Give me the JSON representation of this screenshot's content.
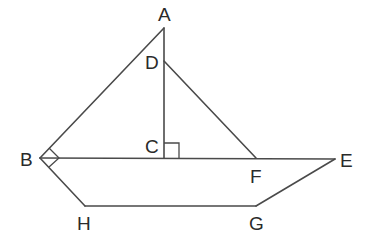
{
  "diagram": {
    "type": "geometry",
    "points": {
      "A": {
        "label": "A",
        "x": 164,
        "y": 28
      },
      "D": {
        "label": "D",
        "x": 164,
        "y": 61
      },
      "C": {
        "label": "C",
        "x": 164,
        "y": 158
      },
      "B": {
        "label": "B",
        "x": 40,
        "y": 158
      },
      "F": {
        "label": "F",
        "x": 256,
        "y": 158
      },
      "E": {
        "label": "E",
        "x": 335,
        "y": 159
      },
      "H": {
        "label": "H",
        "x": 85,
        "y": 206
      },
      "G": {
        "label": "G",
        "x": 256,
        "y": 206
      }
    },
    "segments": [
      "AB",
      "AC",
      "DF",
      "BE",
      "BH",
      "HG",
      "GE"
    ],
    "right_angles": [
      "ACB",
      "ABH"
    ],
    "labels": {
      "A": "A",
      "B": "B",
      "C": "C",
      "D": "D",
      "E": "E",
      "F": "F",
      "G": "G",
      "H": "H"
    }
  }
}
